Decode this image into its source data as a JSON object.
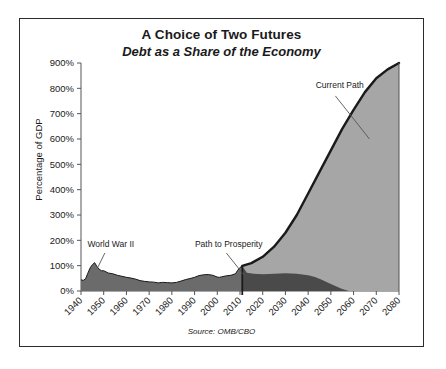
{
  "chart_data": {
    "type": "area",
    "title": "A Choice of Two Futures",
    "subtitle": "Debt as a Share of the Economy",
    "source": "Source: OMB/CBO",
    "xlabel": "",
    "ylabel": "Percentage of GDP",
    "grid": false,
    "legend_position": "none",
    "xlim": [
      1940,
      2080
    ],
    "ylim": [
      0,
      900
    ],
    "ytick_labels": [
      "0%",
      "100%",
      "200%",
      "300%",
      "400%",
      "500%",
      "600%",
      "700%",
      "800%",
      "900%"
    ],
    "ytick_values": [
      0,
      100,
      200,
      300,
      400,
      500,
      600,
      700,
      800,
      900
    ],
    "xtick_labels": [
      "1940",
      "1950",
      "1960",
      "1970",
      "1980",
      "1990",
      "2000",
      "2010",
      "2020",
      "2030",
      "2040",
      "2050",
      "2060",
      "2070",
      "2080"
    ],
    "xtick_values": [
      1940,
      1950,
      1960,
      1970,
      1980,
      1990,
      2000,
      2010,
      2020,
      2030,
      2040,
      2050,
      2060,
      2070,
      2080
    ],
    "annotations": [
      {
        "text": "World War II",
        "x": 1949,
        "y": 175
      },
      {
        "text": "Path to Prosperity",
        "x": 2006,
        "y": 175
      },
      {
        "text": "Current Path",
        "x": 2053,
        "y": 800
      }
    ],
    "series": [
      {
        "name": "Historical",
        "color": "#6b6b6b",
        "x": [
          1940,
          1941,
          1942,
          1943,
          1944,
          1945,
          1946,
          1947,
          1948,
          1949,
          1950,
          1952,
          1954,
          1956,
          1958,
          1960,
          1962,
          1964,
          1966,
          1968,
          1970,
          1972,
          1974,
          1976,
          1978,
          1980,
          1982,
          1984,
          1986,
          1988,
          1990,
          1992,
          1994,
          1996,
          1998,
          2000,
          2001,
          2002,
          2004,
          2006,
          2008,
          2009,
          2010,
          2011
        ],
        "y": [
          44,
          42,
          48,
          70,
          91,
          104,
          112,
          97,
          86,
          80,
          80,
          71,
          68,
          62,
          58,
          54,
          51,
          47,
          41,
          38,
          36,
          35,
          32,
          34,
          33,
          32,
          34,
          39,
          45,
          49,
          54,
          61,
          64,
          65,
          62,
          55,
          54,
          56,
          60,
          62,
          68,
          82,
          93,
          99
        ]
      },
      {
        "name": "Current Path",
        "color": "#a6a6a6",
        "x": [
          2011,
          2015,
          2020,
          2025,
          2030,
          2035,
          2040,
          2045,
          2050,
          2055,
          2060,
          2065,
          2070,
          2075,
          2080
        ],
        "y": [
          99,
          110,
          135,
          175,
          230,
          300,
          385,
          470,
          555,
          640,
          715,
          785,
          840,
          875,
          900
        ]
      },
      {
        "name": "Path to Prosperity",
        "color": "#4a4a4a",
        "x": [
          2011,
          2013,
          2016,
          2020,
          2025,
          2030,
          2035,
          2040,
          2043,
          2046,
          2049,
          2052,
          2055,
          2058
        ],
        "y": [
          99,
          72,
          68,
          66,
          68,
          70,
          68,
          62,
          55,
          44,
          32,
          20,
          8,
          0
        ]
      }
    ]
  }
}
